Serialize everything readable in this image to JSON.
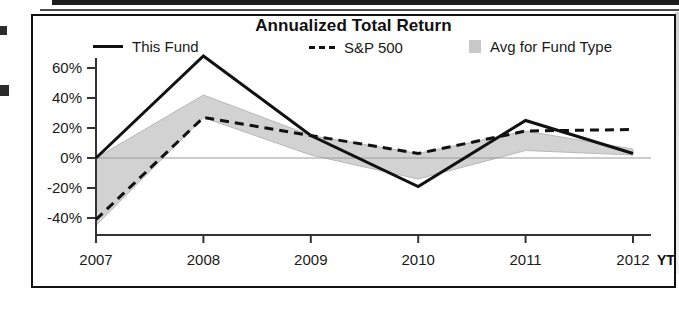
{
  "chart_data": {
    "type": "line",
    "title": "Annualized Total Return",
    "xlabel": "",
    "ylabel": "",
    "categories": [
      "2007",
      "2008",
      "2009",
      "2010",
      "2011",
      "2012 YTD"
    ],
    "tick_labels_x": [
      "2007",
      "2008",
      "2009",
      "2010",
      "2011",
      "2012"
    ],
    "ytd_suffix": "YTD",
    "ylim": [
      -50,
      70
    ],
    "ytick_values": [
      60,
      40,
      20,
      0,
      -20,
      -40
    ],
    "ytick_labels": [
      "60%",
      "40%",
      "20%",
      "0%",
      "-20%",
      "-40%"
    ],
    "grid": false,
    "legend_position": "top",
    "series": [
      {
        "name": "This Fund",
        "style": "solid",
        "color": "#111111",
        "values": [
          0,
          68,
          15,
          -19,
          25,
          3
        ]
      },
      {
        "name": "S&P 500",
        "style": "dashed",
        "color": "#111111",
        "values": [
          -41,
          27,
          15,
          3,
          18,
          19
        ]
      },
      {
        "name": "Avg for Fund Type",
        "style": "band",
        "color": "#d2d2d2",
        "upper": [
          0,
          42,
          15,
          3,
          18,
          6
        ],
        "lower": [
          -45,
          27,
          2,
          -14,
          5,
          2
        ]
      }
    ],
    "legend": [
      {
        "label": "This Fund",
        "marker": "solid-line"
      },
      {
        "label": "S&P 500",
        "marker": "dashed-line"
      },
      {
        "label": "Avg for Fund Type",
        "marker": "gray-swatch"
      }
    ]
  }
}
